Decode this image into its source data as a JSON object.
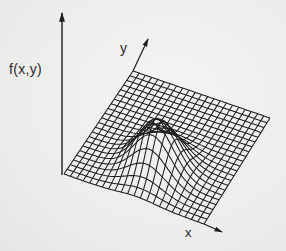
{
  "figure": {
    "type": "3d-surface-wireframe",
    "labels": {
      "z_axis": "f(x,y)",
      "y_axis": "y",
      "x_axis": "x"
    },
    "colors": {
      "ink": "#1e1e1e",
      "background": "#efefed"
    },
    "geometry": {
      "z_axis": {
        "x": 62,
        "y_bottom": 175,
        "y_top": 13
      },
      "grid_corners": {
        "left": [
          64,
          174
        ],
        "back": [
          133,
          71
        ],
        "right": [
          270,
          118
        ],
        "front": [
          204,
          224
        ]
      },
      "y_axis_arrow_tip": [
        148,
        39
      ],
      "x_axis_arrow_tip": [
        222,
        232
      ],
      "grid_cells": 22,
      "bump": {
        "u": 0.52,
        "v": 0.3,
        "height": 48,
        "sigma": 0.13
      }
    }
  }
}
